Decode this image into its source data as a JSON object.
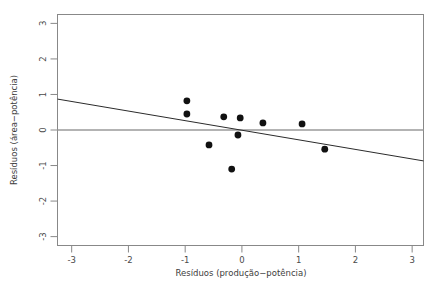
{
  "figure": {
    "kind": "residual-scatter-plot",
    "background_color": "#ffffff",
    "frame_color": "#888888",
    "point_color": "#111111",
    "fit_line_color": "#2b2b2b",
    "zero_line_color": "#9a9a9a"
  },
  "chart_data": {
    "type": "scatter",
    "title": "",
    "xlabel": "Resíduos (produção−potência)",
    "ylabel": "Resíduos (área−potência)",
    "xlim": [
      -3.25,
      3.2
    ],
    "ylim": [
      -3.25,
      3.25
    ],
    "xticks": [
      -3,
      -2,
      -1,
      0,
      1,
      2,
      3
    ],
    "xtick_labels": [
      "-3",
      "-2",
      "-1",
      "0",
      "1",
      "2",
      "3"
    ],
    "yticks": [
      -3,
      -2,
      -1,
      0,
      1,
      2,
      3
    ],
    "ytick_labels": [
      "-3",
      "-2",
      "-1",
      "0",
      "1",
      "2",
      "3"
    ],
    "grid": false,
    "legend": false,
    "x": [
      -0.97,
      -0.97,
      -0.58,
      -0.32,
      -0.18,
      -0.07,
      -0.03,
      0.37,
      1.06,
      1.46
    ],
    "y": [
      0.82,
      0.45,
      -0.42,
      0.37,
      -1.1,
      -0.14,
      0.34,
      0.2,
      0.17,
      -0.54
    ],
    "points": [
      {
        "x": -0.97,
        "y": 0.82
      },
      {
        "x": -0.97,
        "y": 0.45
      },
      {
        "x": -0.58,
        "y": -0.42
      },
      {
        "x": -0.32,
        "y": 0.37
      },
      {
        "x": -0.18,
        "y": -1.1
      },
      {
        "x": -0.07,
        "y": -0.14
      },
      {
        "x": -0.03,
        "y": 0.34
      },
      {
        "x": 0.37,
        "y": 0.2
      },
      {
        "x": 1.06,
        "y": 0.17
      },
      {
        "x": 1.46,
        "y": -0.54
      }
    ],
    "point_radius_px": 3.4,
    "reference_lines": [
      {
        "name": "zero-line",
        "orientation": "horizontal",
        "y": 0,
        "color": "#9a9a9a",
        "width": 1.4
      }
    ],
    "fit_line": {
      "name": "regression-fit-line",
      "x_start": -3.25,
      "y_start": 0.87,
      "x_end": 3.2,
      "y_end": -0.87,
      "intercept": -0.008,
      "slope": -0.27,
      "color": "#2b2b2b",
      "width": 1
    }
  }
}
